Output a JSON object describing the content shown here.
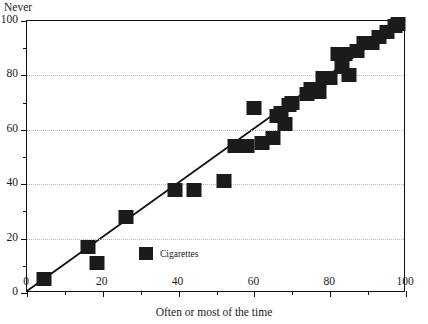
{
  "figure": {
    "title_remnant": "· · · · · · · · · · ·",
    "y_axis_title": "Never",
    "x_axis_title": "Often or most of the time"
  },
  "legend": {
    "label": "Cigarettes"
  },
  "chart_data": {
    "type": "scatter",
    "title": "",
    "xlabel": "Often or most of the time",
    "ylabel": "Never",
    "xlim": [
      0,
      100
    ],
    "ylim": [
      0,
      100
    ],
    "xticks": [
      0,
      20,
      40,
      60,
      80,
      100
    ],
    "yticks": [
      0,
      20,
      40,
      60,
      80,
      100
    ],
    "xtick_labels": [
      "0",
      "20",
      "40",
      "60",
      "80",
      "100"
    ],
    "ytick_labels": [
      "0",
      "20",
      "40",
      "60",
      "80",
      "100"
    ],
    "minor_ticks": [
      10,
      30,
      50,
      70,
      90
    ],
    "grid": "horizontal-dotted",
    "legend_position": "inside-lower-left",
    "marker": "square",
    "marker_color": "#1b1b1b",
    "marker_size_px": 15,
    "series": [
      {
        "name": "Cigarettes",
        "points": [
          [
            4.5,
            5
          ],
          [
            16,
            17
          ],
          [
            18.5,
            11
          ],
          [
            26,
            28
          ],
          [
            39,
            38
          ],
          [
            44,
            38
          ],
          [
            52,
            41
          ],
          [
            55,
            54
          ],
          [
            58,
            54
          ],
          [
            60,
            68
          ],
          [
            62,
            55
          ],
          [
            65,
            57
          ],
          [
            66,
            65
          ],
          [
            67,
            66
          ],
          [
            68,
            62
          ],
          [
            69,
            69
          ],
          [
            70,
            70
          ],
          [
            74,
            73
          ],
          [
            75,
            75
          ],
          [
            77,
            74
          ],
          [
            78,
            79
          ],
          [
            80,
            79
          ],
          [
            82,
            88
          ],
          [
            83,
            83
          ],
          [
            84,
            88
          ],
          [
            85,
            80
          ],
          [
            87,
            89
          ],
          [
            89,
            92
          ],
          [
            91,
            92
          ],
          [
            93,
            94
          ],
          [
            95,
            96
          ],
          [
            97,
            98
          ],
          [
            98,
            99
          ]
        ]
      }
    ],
    "fit_line": {
      "type": "linear",
      "from": [
        0,
        0
      ],
      "to": [
        99,
        99
      ]
    }
  }
}
